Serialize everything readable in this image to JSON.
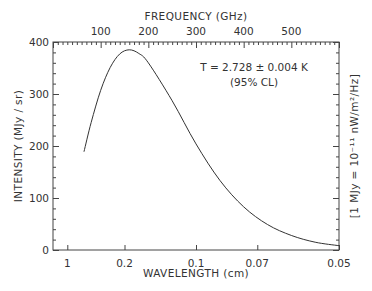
{
  "chart_data": {
    "type": "line",
    "title": "",
    "xlabel": "WAVELENGTH (cm)",
    "x2label": "FREQUENCY (GHz)",
    "ylabel": "INTENSITY (MJy / sr)",
    "y2label": "[1 MJy = 10⁻¹¹ nW/m²/Hz]",
    "xlim_ghz": [
      0,
      600
    ],
    "ylim": [
      0,
      400
    ],
    "grid": false,
    "legend": "none",
    "bottom_ticks": [
      {
        "label": "1",
        "wavelength_cm": 1,
        "ghz": 30
      },
      {
        "label": "0.2",
        "wavelength_cm": 0.2,
        "ghz": 150
      },
      {
        "label": "0.1",
        "wavelength_cm": 0.1,
        "ghz": 300
      },
      {
        "label": "0.07",
        "wavelength_cm": 0.07,
        "ghz": 428.57
      },
      {
        "label": "0.05",
        "wavelength_cm": 0.05,
        "ghz": 600
      }
    ],
    "top_ticks": [
      {
        "label": "100",
        "ghz": 100
      },
      {
        "label": "200",
        "ghz": 200
      },
      {
        "label": "300",
        "ghz": 300
      },
      {
        "label": "400",
        "ghz": 400
      },
      {
        "label": "500",
        "ghz": 500
      }
    ],
    "y_ticks": [
      {
        "label": "0",
        "value": 0
      },
      {
        "label": "100",
        "value": 100
      },
      {
        "label": "200",
        "value": 200
      },
      {
        "label": "300",
        "value": 300
      },
      {
        "label": "400",
        "value": 400
      }
    ],
    "annotation": {
      "line1": "T = 2.728 ± 0.004 K",
      "line2": "(95% CL)"
    },
    "series": [
      {
        "name": "Blackbody spectrum T = 2.728 K",
        "color": "#333333",
        "x_ghz": [
          65,
          80,
          100,
          120,
          140,
          160,
          180,
          200,
          250,
          300,
          350,
          400,
          450,
          500,
          550,
          600
        ],
        "y_mjy_sr": [
          189,
          245,
          307,
          351,
          377,
          385,
          378,
          360,
          287,
          204,
          134,
          83,
          49,
          28,
          15,
          8.3
        ]
      }
    ]
  }
}
